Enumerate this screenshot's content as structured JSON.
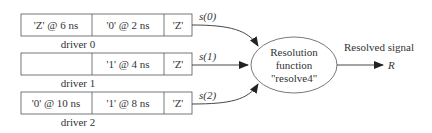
{
  "drivers": [
    {
      "label": "driver 0",
      "cells": [
        "'Z' @ 6 ns",
        "'0' @ 2 ns",
        "'Z'"
      ],
      "signal": "s(0)"
    },
    {
      "label": "driver 1",
      "cells": [
        "",
        "'1' @ 4 ns",
        "'Z'"
      ],
      "signal": "s(1)"
    },
    {
      "label": "driver 2",
      "cells": [
        "'0' @ 10 ns",
        "'1' @ 8 ns",
        "'Z'"
      ],
      "signal": "s(2)"
    }
  ],
  "resolution": {
    "line1": "Resolution",
    "line2": "function",
    "line3": "\"resolve4\""
  },
  "output": {
    "caption": "Resolved signal",
    "name": "R"
  },
  "colors": {
    "stroke": "#555555",
    "text": "#333333"
  }
}
